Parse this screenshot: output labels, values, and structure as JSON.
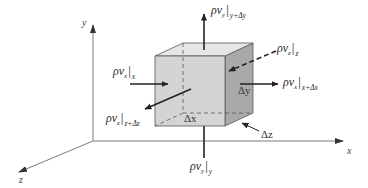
{
  "diagram": {
    "type": "control-volume-cube",
    "axes": {
      "x_label": "x",
      "y_label": "y",
      "z_label": "z"
    },
    "dimensions": {
      "dx": "Δx",
      "dy": "Δy",
      "dz": "Δz"
    },
    "fluxes": {
      "x_in": {
        "symbol": "ρv",
        "component": "x",
        "eval_at": "x"
      },
      "x_out": {
        "symbol": "ρv",
        "component": "x",
        "eval_at": "x+Δx"
      },
      "y_in": {
        "symbol": "ρv",
        "component": "y",
        "eval_at": "y"
      },
      "y_out": {
        "symbol": "ρv",
        "component": "y",
        "eval_at": "y+Δy"
      },
      "z_in": {
        "symbol": "ρv",
        "component": "z",
        "eval_at": "z"
      },
      "z_out": {
        "symbol": "ρv",
        "component": "z",
        "eval_at": "z+Δz"
      }
    },
    "colors": {
      "front_face": "#d6d6d6",
      "top_face": "#e4e4e4",
      "side_face": "#a9a9a9",
      "edge": "#555555",
      "axis": "#6a6a6a",
      "arrow": "#222222"
    }
  }
}
